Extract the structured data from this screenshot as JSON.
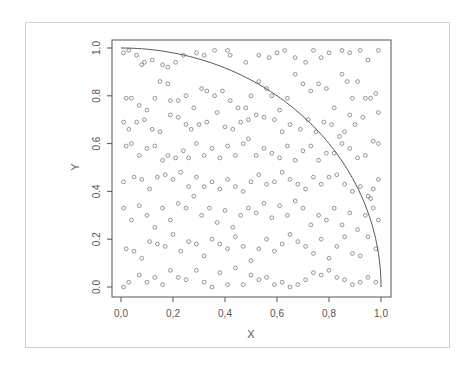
{
  "figure": {
    "border_color": "#cfcfcf",
    "frame_color": "#555555",
    "point_color": "#6a6a6a",
    "curve_color": "#555555",
    "text_color": "#555555"
  },
  "chart_data": {
    "type": "scatter",
    "title": "",
    "xlabel": "X",
    "ylabel": "Y",
    "xlim": [
      0,
      1
    ],
    "ylim": [
      0,
      1
    ],
    "grid": false,
    "legend": null,
    "x_ticks": [
      0.0,
      0.2,
      0.4,
      0.6,
      0.8,
      1.0
    ],
    "x_tick_labels": [
      "0,0",
      "0,2",
      "0,4",
      "0,6",
      "0,8",
      "1,0"
    ],
    "y_ticks": [
      0.0,
      0.2,
      0.4,
      0.6,
      0.8,
      1.0
    ],
    "y_tick_labels": [
      "0.0",
      "0.2",
      "0.4",
      "0.6",
      "0.8",
      "1.0"
    ],
    "annotations": [
      {
        "type": "curve",
        "description": "quarter unit circle y = sqrt(1 - x^2)",
        "x_range": [
          0,
          1
        ]
      }
    ],
    "point_count_estimate": 1000,
    "points_note": "Uniform random points in the unit square (Monte Carlo pi estimation); coordinates below are an approximate sample read from the image.",
    "points": [
      [
        0.01,
        0.98
      ],
      [
        0.03,
        0.99
      ],
      [
        0.06,
        0.97
      ],
      [
        0.08,
        0.93
      ],
      [
        0.09,
        0.94
      ],
      [
        0.12,
        0.95
      ],
      [
        0.16,
        0.93
      ],
      [
        0.18,
        0.92
      ],
      [
        0.21,
        0.94
      ],
      [
        0.24,
        0.97
      ],
      [
        0.29,
        0.98
      ],
      [
        0.32,
        0.97
      ],
      [
        0.36,
        0.99
      ],
      [
        0.41,
        0.99
      ],
      [
        0.42,
        0.97
      ],
      [
        0.48,
        0.94
      ],
      [
        0.53,
        0.97
      ],
      [
        0.57,
        0.96
      ],
      [
        0.6,
        0.98
      ],
      [
        0.63,
        0.99
      ],
      [
        0.67,
        0.96
      ],
      [
        0.71,
        0.94
      ],
      [
        0.74,
        0.99
      ],
      [
        0.77,
        0.96
      ],
      [
        0.8,
        0.98
      ],
      [
        0.85,
        0.99
      ],
      [
        0.88,
        0.98
      ],
      [
        0.92,
        0.99
      ],
      [
        0.95,
        0.95
      ],
      [
        0.99,
        0.99
      ],
      [
        0.02,
        0.79
      ],
      [
        0.04,
        0.79
      ],
      [
        0.07,
        0.76
      ],
      [
        0.1,
        0.74
      ],
      [
        0.13,
        0.79
      ],
      [
        0.15,
        0.86
      ],
      [
        0.18,
        0.85
      ],
      [
        0.19,
        0.78
      ],
      [
        0.22,
        0.78
      ],
      [
        0.25,
        0.8
      ],
      [
        0.28,
        0.75
      ],
      [
        0.31,
        0.83
      ],
      [
        0.33,
        0.82
      ],
      [
        0.36,
        0.8
      ],
      [
        0.39,
        0.82
      ],
      [
        0.42,
        0.78
      ],
      [
        0.45,
        0.75
      ],
      [
        0.48,
        0.75
      ],
      [
        0.5,
        0.8
      ],
      [
        0.53,
        0.86
      ],
      [
        0.56,
        0.83
      ],
      [
        0.58,
        0.8
      ],
      [
        0.61,
        0.74
      ],
      [
        0.64,
        0.79
      ],
      [
        0.67,
        0.89
      ],
      [
        0.7,
        0.85
      ],
      [
        0.73,
        0.82
      ],
      [
        0.76,
        0.85
      ],
      [
        0.79,
        0.83
      ],
      [
        0.82,
        0.75
      ],
      [
        0.85,
        0.89
      ],
      [
        0.87,
        0.86
      ],
      [
        0.89,
        0.79
      ],
      [
        0.91,
        0.86
      ],
      [
        0.94,
        0.79
      ],
      [
        0.96,
        0.79
      ],
      [
        0.98,
        0.81
      ],
      [
        0.99,
        0.73
      ],
      [
        0.93,
        0.71
      ],
      [
        0.88,
        0.72
      ],
      [
        0.01,
        0.69
      ],
      [
        0.03,
        0.66
      ],
      [
        0.06,
        0.69
      ],
      [
        0.09,
        0.7
      ],
      [
        0.12,
        0.66
      ],
      [
        0.15,
        0.65
      ],
      [
        0.19,
        0.72
      ],
      [
        0.22,
        0.71
      ],
      [
        0.25,
        0.68
      ],
      [
        0.27,
        0.66
      ],
      [
        0.3,
        0.68
      ],
      [
        0.33,
        0.69
      ],
      [
        0.37,
        0.73
      ],
      [
        0.4,
        0.67
      ],
      [
        0.43,
        0.66
      ],
      [
        0.46,
        0.69
      ],
      [
        0.49,
        0.7
      ],
      [
        0.52,
        0.72
      ],
      [
        0.55,
        0.71
      ],
      [
        0.59,
        0.7
      ],
      [
        0.62,
        0.65
      ],
      [
        0.65,
        0.68
      ],
      [
        0.69,
        0.66
      ],
      [
        0.72,
        0.7
      ],
      [
        0.75,
        0.65
      ],
      [
        0.78,
        0.69
      ],
      [
        0.81,
        0.68
      ],
      [
        0.84,
        0.63
      ],
      [
        0.86,
        0.65
      ],
      [
        0.9,
        0.68
      ],
      [
        0.02,
        0.59
      ],
      [
        0.04,
        0.6
      ],
      [
        0.07,
        0.55
      ],
      [
        0.1,
        0.58
      ],
      [
        0.13,
        0.59
      ],
      [
        0.16,
        0.53
      ],
      [
        0.18,
        0.55
      ],
      [
        0.21,
        0.54
      ],
      [
        0.24,
        0.57
      ],
      [
        0.26,
        0.54
      ],
      [
        0.29,
        0.6
      ],
      [
        0.32,
        0.55
      ],
      [
        0.35,
        0.58
      ],
      [
        0.38,
        0.54
      ],
      [
        0.41,
        0.59
      ],
      [
        0.44,
        0.55
      ],
      [
        0.47,
        0.6
      ],
      [
        0.49,
        0.62
      ],
      [
        0.52,
        0.55
      ],
      [
        0.55,
        0.58
      ],
      [
        0.58,
        0.56
      ],
      [
        0.61,
        0.54
      ],
      [
        0.64,
        0.59
      ],
      [
        0.67,
        0.53
      ],
      [
        0.7,
        0.57
      ],
      [
        0.73,
        0.59
      ],
      [
        0.76,
        0.53
      ],
      [
        0.79,
        0.56
      ],
      [
        0.82,
        0.56
      ],
      [
        0.85,
        0.6
      ],
      [
        0.88,
        0.58
      ],
      [
        0.91,
        0.54
      ],
      [
        0.94,
        0.55
      ],
      [
        0.97,
        0.61
      ],
      [
        0.99,
        0.6
      ],
      [
        0.01,
        0.44
      ],
      [
        0.05,
        0.46
      ],
      [
        0.08,
        0.45
      ],
      [
        0.11,
        0.41
      ],
      [
        0.14,
        0.46
      ],
      [
        0.17,
        0.47
      ],
      [
        0.2,
        0.45
      ],
      [
        0.23,
        0.48
      ],
      [
        0.26,
        0.42
      ],
      [
        0.29,
        0.46
      ],
      [
        0.32,
        0.42
      ],
      [
        0.35,
        0.44
      ],
      [
        0.38,
        0.41
      ],
      [
        0.41,
        0.45
      ],
      [
        0.44,
        0.42
      ],
      [
        0.47,
        0.4
      ],
      [
        0.5,
        0.44
      ],
      [
        0.53,
        0.47
      ],
      [
        0.56,
        0.43
      ],
      [
        0.59,
        0.44
      ],
      [
        0.62,
        0.48
      ],
      [
        0.65,
        0.45
      ],
      [
        0.68,
        0.43
      ],
      [
        0.71,
        0.41
      ],
      [
        0.74,
        0.46
      ],
      [
        0.77,
        0.43
      ],
      [
        0.8,
        0.46
      ],
      [
        0.83,
        0.47
      ],
      [
        0.86,
        0.43
      ],
      [
        0.89,
        0.4
      ],
      [
        0.92,
        0.42
      ],
      [
        0.95,
        0.38
      ],
      [
        0.96,
        0.37
      ],
      [
        0.99,
        0.45
      ],
      [
        0.97,
        0.41
      ],
      [
        0.01,
        0.33
      ],
      [
        0.04,
        0.28
      ],
      [
        0.07,
        0.34
      ],
      [
        0.1,
        0.3
      ],
      [
        0.13,
        0.25
      ],
      [
        0.16,
        0.33
      ],
      [
        0.19,
        0.28
      ],
      [
        0.22,
        0.35
      ],
      [
        0.25,
        0.33
      ],
      [
        0.28,
        0.38
      ],
      [
        0.31,
        0.3
      ],
      [
        0.34,
        0.33
      ],
      [
        0.37,
        0.27
      ],
      [
        0.4,
        0.32
      ],
      [
        0.43,
        0.25
      ],
      [
        0.46,
        0.3
      ],
      [
        0.49,
        0.33
      ],
      [
        0.52,
        0.31
      ],
      [
        0.55,
        0.35
      ],
      [
        0.58,
        0.29
      ],
      [
        0.61,
        0.34
      ],
      [
        0.64,
        0.3
      ],
      [
        0.67,
        0.36
      ],
      [
        0.7,
        0.33
      ],
      [
        0.73,
        0.26
      ],
      [
        0.76,
        0.3
      ],
      [
        0.79,
        0.28
      ],
      [
        0.82,
        0.33
      ],
      [
        0.85,
        0.26
      ],
      [
        0.88,
        0.31
      ],
      [
        0.91,
        0.24
      ],
      [
        0.94,
        0.3
      ],
      [
        0.97,
        0.33
      ],
      [
        0.99,
        0.28
      ],
      [
        0.02,
        0.16
      ],
      [
        0.05,
        0.15
      ],
      [
        0.08,
        0.12
      ],
      [
        0.11,
        0.19
      ],
      [
        0.14,
        0.18
      ],
      [
        0.17,
        0.17
      ],
      [
        0.2,
        0.22
      ],
      [
        0.23,
        0.15
      ],
      [
        0.26,
        0.19
      ],
      [
        0.29,
        0.18
      ],
      [
        0.32,
        0.13
      ],
      [
        0.35,
        0.2
      ],
      [
        0.38,
        0.18
      ],
      [
        0.41,
        0.16
      ],
      [
        0.44,
        0.21
      ],
      [
        0.47,
        0.17
      ],
      [
        0.5,
        0.11
      ],
      [
        0.53,
        0.16
      ],
      [
        0.56,
        0.2
      ],
      [
        0.59,
        0.15
      ],
      [
        0.62,
        0.18
      ],
      [
        0.65,
        0.22
      ],
      [
        0.68,
        0.19
      ],
      [
        0.71,
        0.17
      ],
      [
        0.74,
        0.14
      ],
      [
        0.77,
        0.2
      ],
      [
        0.8,
        0.12
      ],
      [
        0.83,
        0.17
      ],
      [
        0.86,
        0.21
      ],
      [
        0.89,
        0.14
      ],
      [
        0.92,
        0.13
      ],
      [
        0.95,
        0.21
      ],
      [
        0.98,
        0.16
      ],
      [
        0.01,
        0.0
      ],
      [
        0.03,
        0.02
      ],
      [
        0.07,
        0.05
      ],
      [
        0.1,
        0.02
      ],
      [
        0.13,
        0.04
      ],
      [
        0.16,
        0.01
      ],
      [
        0.19,
        0.07
      ],
      [
        0.22,
        0.04
      ],
      [
        0.25,
        0.03
      ],
      [
        0.29,
        0.07
      ],
      [
        0.32,
        0.02
      ],
      [
        0.35,
        0.0
      ],
      [
        0.38,
        0.06
      ],
      [
        0.41,
        0.01
      ],
      [
        0.44,
        0.08
      ],
      [
        0.47,
        0.01
      ],
      [
        0.5,
        0.05
      ],
      [
        0.53,
        0.03
      ],
      [
        0.56,
        0.04
      ],
      [
        0.59,
        0.01
      ],
      [
        0.62,
        0.02
      ],
      [
        0.65,
        0.0
      ],
      [
        0.68,
        0.01
      ],
      [
        0.71,
        0.03
      ],
      [
        0.74,
        0.06
      ],
      [
        0.77,
        0.05
      ],
      [
        0.8,
        0.07
      ],
      [
        0.83,
        0.04
      ],
      [
        0.86,
        0.03
      ],
      [
        0.89,
        0.01
      ],
      [
        0.92,
        0.02
      ],
      [
        0.95,
        0.04
      ],
      [
        0.98,
        0.02
      ]
    ]
  }
}
